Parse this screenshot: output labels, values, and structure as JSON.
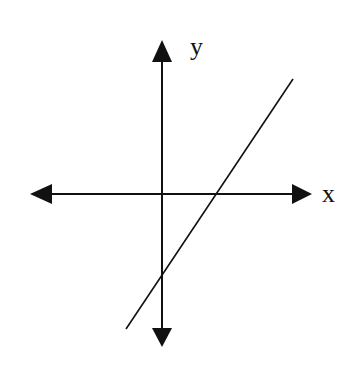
{
  "diagram": {
    "type": "coordinate-plane-with-line",
    "axes": {
      "x_label": "x",
      "y_label": "y",
      "origin": [
        162,
        194
      ],
      "x_axis": {
        "from": [
          30,
          194
        ],
        "to": [
          312,
          194
        ]
      },
      "y_axis": {
        "from": [
          162,
          40
        ],
        "to": [
          162,
          347
        ]
      }
    },
    "line": {
      "from": [
        126,
        329
      ],
      "to": [
        293,
        79
      ],
      "description": "Line with positive slope, positive x-intercept and negative y-intercept"
    },
    "colors": {
      "stroke": "#111111",
      "background": "#ffffff"
    }
  }
}
